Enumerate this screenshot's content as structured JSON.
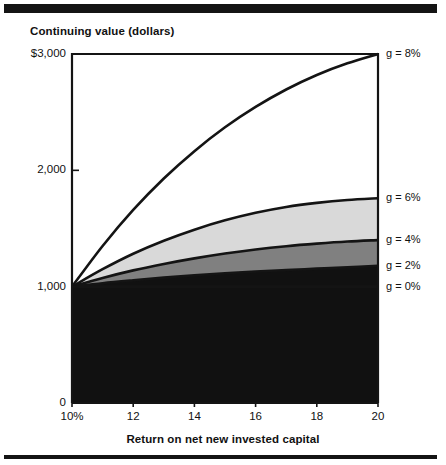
{
  "figure": {
    "title": "Continuing value (dollars)",
    "xaxis_title": "Return on net new invested capital"
  },
  "chart_data": {
    "type": "area",
    "title": "Continuing value (dollars)",
    "subtitle": "",
    "xlabel": "Return on net new invested capital",
    "ylabel": "Continuing value (dollars)",
    "xlim": [
      10,
      20
    ],
    "ylim": [
      0,
      3000
    ],
    "xticks": [
      10,
      12,
      14,
      16,
      18,
      20
    ],
    "xtick_labels": [
      "10%",
      "12",
      "14",
      "16",
      "18",
      "20"
    ],
    "yticks": [
      0,
      1000,
      2000,
      3000
    ],
    "ytick_labels": [
      "0",
      "1,000",
      "2,000",
      "$3,000"
    ],
    "grid": false,
    "legend_position": "right-of-plot",
    "stacked": true,
    "x": [
      10,
      11,
      12,
      13,
      14,
      15,
      16,
      17,
      18,
      19,
      20
    ],
    "series": [
      {
        "name": "g = 0%",
        "label": "g = 0%",
        "color": "#111111",
        "values": [
          1000,
          1000,
          1000,
          1000,
          1000,
          1000,
          1000,
          1000,
          1000,
          1000,
          1000
        ]
      },
      {
        "name": "g = 2%",
        "label": "g = 2%",
        "color": "#111111",
        "values": [
          1000,
          1030,
          1055,
          1078,
          1098,
          1115,
          1130,
          1143,
          1155,
          1167,
          1180
        ]
      },
      {
        "name": "g = 4%",
        "label": "g = 4%",
        "color": "#808080",
        "values": [
          1000,
          1075,
          1140,
          1195,
          1243,
          1285,
          1320,
          1348,
          1370,
          1388,
          1400
        ]
      },
      {
        "name": "g = 6%",
        "label": "g = 6%",
        "color": "#d9d9d9",
        "values": [
          1000,
          1150,
          1283,
          1395,
          1490,
          1570,
          1635,
          1685,
          1720,
          1745,
          1760
        ]
      },
      {
        "name": "g = 8%",
        "label": "g = 8%",
        "color": "#ffffff",
        "values": [
          1000,
          1350,
          1660,
          1930,
          2165,
          2370,
          2545,
          2695,
          2820,
          2920,
          3000
        ]
      }
    ],
    "annotations": [
      {
        "text": "g = 8%",
        "x": 20,
        "y": 3000
      },
      {
        "text": "g = 6%",
        "x": 20,
        "y": 1760
      },
      {
        "text": "g = 4%",
        "x": 20,
        "y": 1400
      },
      {
        "text": "g = 2%",
        "x": 20,
        "y": 1180
      },
      {
        "text": "g = 0%",
        "x": 20,
        "y": 1000
      }
    ]
  },
  "axes": {
    "y_labels": [
      {
        "text": "$3,000",
        "value": 3000
      },
      {
        "text": "2,000",
        "value": 2000
      },
      {
        "text": "1,000",
        "value": 1000
      },
      {
        "text": "0",
        "value": 0
      }
    ],
    "x_labels": [
      {
        "text": "10%",
        "value": 10
      },
      {
        "text": "12",
        "value": 12
      },
      {
        "text": "14",
        "value": 14
      },
      {
        "text": "16",
        "value": 16
      },
      {
        "text": "18",
        "value": 18
      },
      {
        "text": "20",
        "value": 20
      }
    ]
  },
  "legend": {
    "items": [
      {
        "label": "g = 8%"
      },
      {
        "label": "g = 6%"
      },
      {
        "label": "g = 4%"
      },
      {
        "label": "g = 2%"
      },
      {
        "label": "g = 0%"
      }
    ]
  }
}
